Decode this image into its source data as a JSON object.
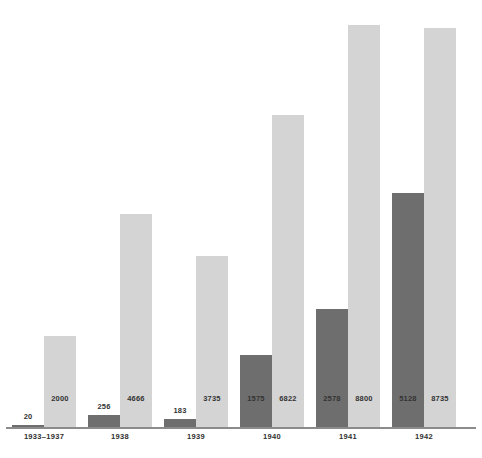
{
  "title": "after the start of the war",
  "axis": {
    "line_color": "#8b8b8b",
    "baseline_y": 427
  },
  "colors": {
    "dark_series": "#6e6e6e",
    "light_series": "#d4d4d4",
    "label_text": "#333333",
    "background": "#ffffff"
  },
  "chart_data": {
    "type": "bar",
    "title": "after the start of the war",
    "xlabel": "",
    "ylabel": "",
    "grid": false,
    "legend_position": "none",
    "ylim": [
      0,
      9000
    ],
    "categories": [
      "1933–1937",
      "1938",
      "1939",
      "1940",
      "1941",
      "1942"
    ],
    "series": [
      {
        "name": "dark",
        "color": "#6e6e6e",
        "values": [
          20,
          256,
          183,
          1575,
          2578,
          5128
        ]
      },
      {
        "name": "light",
        "color": "#d4d4d4",
        "values": [
          2000,
          4666,
          3735,
          6822,
          8800,
          8735
        ]
      }
    ]
  },
  "groups": [
    {
      "label": "1933–1937",
      "dark_value": "20",
      "light_value": "2000"
    },
    {
      "label": "1938",
      "dark_value": "256",
      "light_value": "4666"
    },
    {
      "label": "1939",
      "dark_value": "183",
      "light_value": "3735"
    },
    {
      "label": "1940",
      "dark_value": "1575",
      "light_value": "6822"
    },
    {
      "label": "1941",
      "dark_value": "2578",
      "light_value": "8800"
    },
    {
      "label": "1942",
      "dark_value": "5128",
      "light_value": "8735"
    }
  ]
}
